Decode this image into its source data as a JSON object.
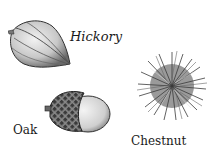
{
  "illustration": {
    "items": [
      {
        "name": "hickory",
        "label": "Hickory"
      },
      {
        "name": "oak",
        "label": "Oak"
      },
      {
        "name": "chestnut",
        "label": "Chestnut"
      }
    ]
  }
}
